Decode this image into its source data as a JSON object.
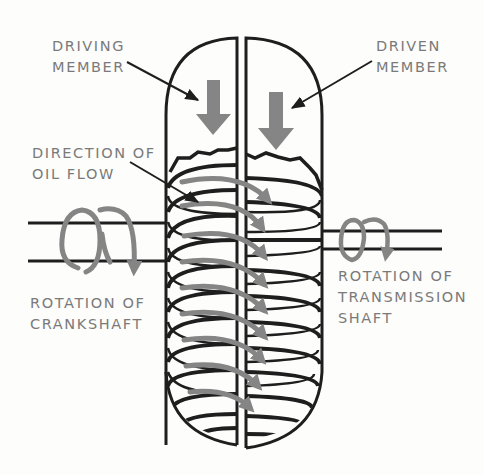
{
  "diagram": {
    "labels": {
      "driving_member": [
        "DRIVING",
        "MEMBER"
      ],
      "driven_member": [
        "DRIVEN",
        "MEMBER"
      ],
      "oil_flow": [
        "DIRECTION OF",
        "OIL FLOW"
      ],
      "crankshaft": [
        "ROTATION OF",
        "CRANKSHAFT"
      ],
      "transmission": [
        "ROTATION OF",
        "TRANSMISSION",
        "SHAFT"
      ]
    },
    "colors": {
      "line": "#1e1e1e",
      "arrow_gray": "#858585",
      "label_gray": "#7a7a7a",
      "background": "#fdfdfc"
    }
  }
}
